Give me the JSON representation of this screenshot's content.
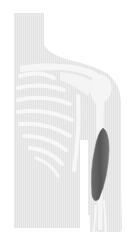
{
  "illustration": {
    "subject": "upper-body anatomy, right arm",
    "highlighted_muscle": "upper arm muscle",
    "colors": {
      "background": "#ffffff",
      "body": "#e9e9e9",
      "bone": "#f6f6f6",
      "muscle": "#5f5f5f",
      "muscle_edge": "#7a7a7a"
    }
  }
}
